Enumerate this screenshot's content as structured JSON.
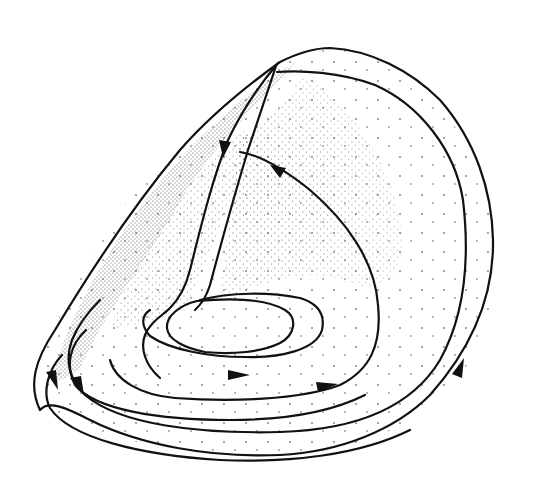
{
  "figure": {
    "type": "stippled-surface-flow-diagram",
    "colors": {
      "background": "#ffffff",
      "ink": "#111111"
    },
    "arrows": [
      {
        "id": "arrow-upper-left-down",
        "x": 224,
        "y": 147,
        "direction": "down"
      },
      {
        "id": "arrow-upper-middle-left",
        "x": 277,
        "y": 170,
        "direction": "up-left"
      },
      {
        "id": "arrow-left-outer-down",
        "x": 55,
        "y": 380,
        "direction": "down"
      },
      {
        "id": "arrow-left-inner-down",
        "x": 78,
        "y": 385,
        "direction": "down"
      },
      {
        "id": "arrow-bottom-inner-right",
        "x": 240,
        "y": 375,
        "direction": "right"
      },
      {
        "id": "arrow-bottom-middle-right",
        "x": 327,
        "y": 385,
        "direction": "right"
      },
      {
        "id": "arrow-right-up",
        "x": 463,
        "y": 370,
        "direction": "up-right"
      }
    ]
  }
}
